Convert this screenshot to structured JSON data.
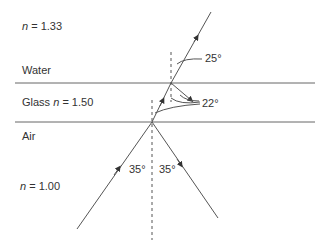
{
  "media": {
    "top": {
      "name": "Water",
      "n_symbol": "n",
      "n_value": "= 1.33"
    },
    "middle": {
      "name": "Glass",
      "n_symbol": "n",
      "n_value": "= 1.50"
    },
    "bottom": {
      "name": "Air",
      "n_symbol": "n",
      "n_value": "= 1.00"
    }
  },
  "angles": {
    "incident": "35°",
    "reflected": "35°",
    "in_glass": "22°",
    "in_water": "25°"
  },
  "colors": {
    "line": "#555555",
    "text": "#333333",
    "background": "#ffffff"
  }
}
